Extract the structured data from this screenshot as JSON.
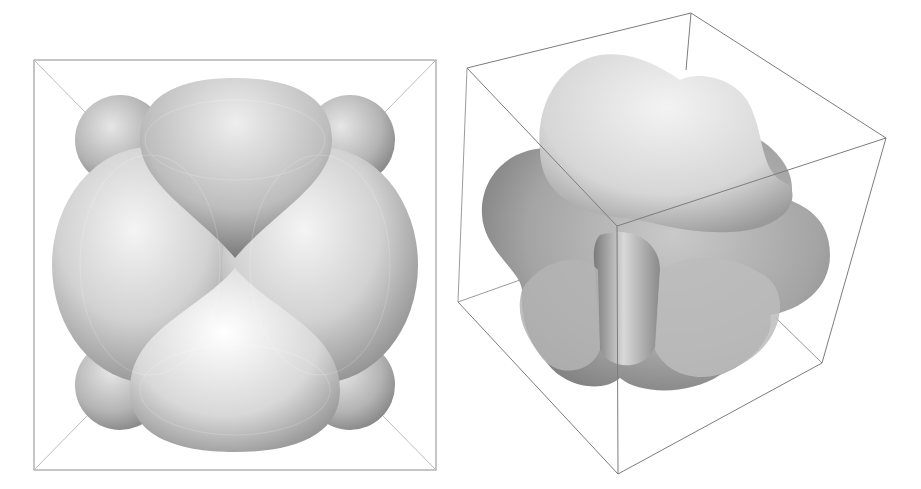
{
  "figure": {
    "panels": [
      {
        "id": "left",
        "view": "axis-aligned front view",
        "object": "isosurface with cubic symmetry (8 corner lobes, 4 large side lobes)"
      },
      {
        "id": "right",
        "view": "oblique perspective view inside bounding cube",
        "object": "same isosurface rotated"
      }
    ],
    "colors": {
      "background": "#ffffff",
      "frame_line": "#888888",
      "surface_light": "#ececec",
      "surface_mid": "#b8b8b8",
      "surface_dark": "#707070"
    }
  }
}
